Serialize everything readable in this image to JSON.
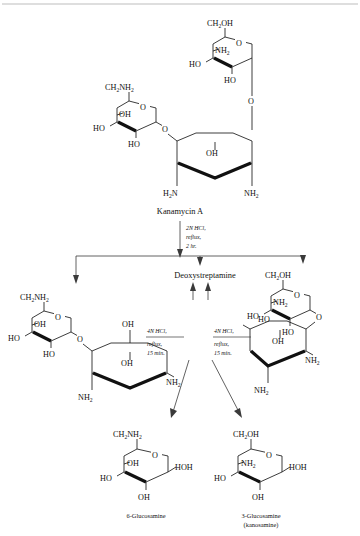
{
  "figure": {
    "type": "chemical-reaction-scheme",
    "title_compound": "Kanamycin A",
    "core_label": "Deoxystreptamine",
    "background_color": "#ffffff",
    "line_color": "#1a1a1a",
    "arrow_color": "#3a3a3a"
  },
  "labels": {
    "kanamycin_a": "Kanamycin A",
    "deoxystreptamine": "Deoxystreptamine",
    "glucosamine_6": "6-Glucosamine",
    "glucosamine_3": "3-Glucosamine",
    "kanosamine": "(kanosamine)"
  },
  "conditions": {
    "main": {
      "normality": "2N",
      "reagent": "HCl,",
      "line2": "reflux,",
      "line3": "2  hr."
    },
    "left_branch": {
      "normality": "4N",
      "reagent": "HCl,",
      "line2": "reflux,",
      "line3": "15 min."
    },
    "right_branch": {
      "normality": "4N",
      "reagent": "HCl,",
      "line2": "reflux,",
      "line3": "15 min."
    }
  },
  "atoms": {
    "ch2oh": "CH",
    "ch2oh_sub": "2",
    "ch2oh_tail": "OH",
    "ch2nh2": "CH",
    "ch2nh2_sub": "2",
    "ch2nh2_tail": "NH",
    "ch2nh2_sub2": "2",
    "oh": "OH",
    "ho": "HO",
    "hoh": "HOH",
    "o": "O",
    "nh2": "NH",
    "nh2_sub": "2",
    "h2n_h": "H",
    "h2n_sub": "2",
    "h2n_n": "N"
  },
  "structures": {
    "kanamycin_a": {
      "name": "Kanamycin A",
      "rings": [
        {
          "id": "ring-3-amino-sugar-top",
          "substituents": [
            "CH2OH",
            "NH2",
            "HO",
            "HO",
            "O"
          ]
        },
        {
          "id": "ring-6-aminoglucose-left",
          "substituents": [
            "CH2NH2",
            "OH",
            "HO",
            "HO",
            "O"
          ]
        },
        {
          "id": "ring-deoxystreptamine",
          "substituents": [
            "OH",
            "H2N",
            "NH2"
          ]
        }
      ]
    },
    "product_left": {
      "id": "disaccharide-left",
      "rings": [
        {
          "id": "ring-6-aminoglucose",
          "substituents": [
            "CH2NH2",
            "OH",
            "HO",
            "HO",
            "O"
          ]
        },
        {
          "id": "ring-deoxystreptamine",
          "substituents": [
            "OH",
            "OH",
            "NH2",
            "NH2"
          ]
        }
      ]
    },
    "product_right": {
      "id": "disaccharide-right",
      "rings": [
        {
          "id": "ring-3-aminoglucose",
          "substituents": [
            "CH2OH",
            "NH2",
            "HO",
            "HO",
            "O"
          ]
        },
        {
          "id": "ring-deoxystreptamine",
          "substituents": [
            "HO",
            "OH",
            "NH2",
            "NH2"
          ]
        }
      ]
    },
    "product_bottom_left": {
      "id": "6-glucosamine",
      "label": "6-Glucosamine",
      "substituents": [
        "CH2NH2",
        "O",
        "OH",
        "HO",
        "HOH",
        "OH"
      ]
    },
    "product_bottom_right": {
      "id": "3-glucosamine-kanosamine",
      "label": "3-Glucosamine",
      "sublabel": "(kanosamine)",
      "substituents": [
        "CH2OH",
        "O",
        "NH2",
        "HO",
        "HOH",
        "OH"
      ]
    }
  }
}
